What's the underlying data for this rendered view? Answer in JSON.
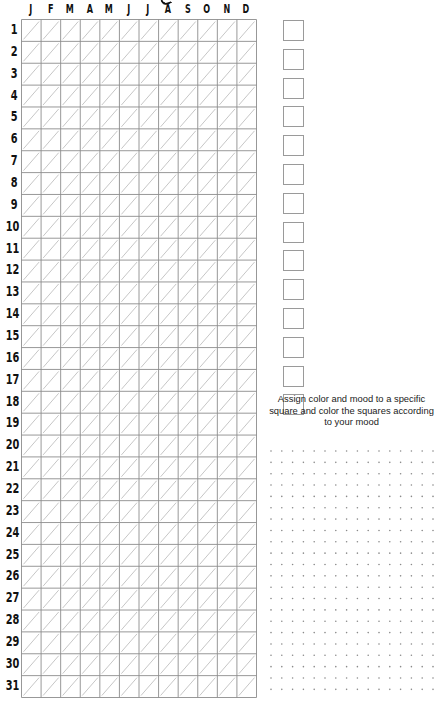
{
  "months": [
    "J",
    "F",
    "M",
    "A",
    "M",
    "J",
    "J",
    "A",
    "S",
    "O",
    "N",
    "D"
  ],
  "days": [
    "1",
    "2",
    "3",
    "4",
    "5",
    "6",
    "7",
    "8",
    "9",
    "10",
    "11",
    "12",
    "13",
    "14",
    "15",
    "16",
    "17",
    "18",
    "19",
    "20",
    "21",
    "22",
    "23",
    "24",
    "25",
    "26",
    "27",
    "28",
    "29",
    "30",
    "31"
  ],
  "mood_squares_count": 14,
  "instructions": "Assign color and mood to a specific square and color the squares according to your mood",
  "dot_grid": {
    "rows": 22,
    "cols": 16
  },
  "colors": {
    "grid_line": "#8c8c8c",
    "diagonal": "#b8b8b8",
    "dot": "#8a8a8a",
    "text": "#111111"
  }
}
